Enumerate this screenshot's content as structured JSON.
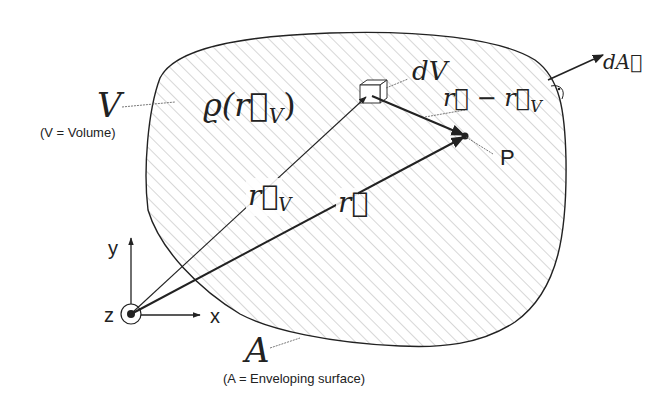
{
  "diagram": {
    "type": "physics-vector-field-volume",
    "colors": {
      "ink": "#222222",
      "hatch": "#9a9a9a",
      "background": "#ffffff"
    },
    "volume": {
      "symbol": "V",
      "caption": "(V = Volume)",
      "density_label": "ϱ(r⃗",
      "density_sub": "V",
      "density_close": ")"
    },
    "surface": {
      "symbol": "A",
      "caption": "(A = Enveloping surface)",
      "normal_label": "dA⃗"
    },
    "element": {
      "label": "dV"
    },
    "vectors": {
      "r": "r⃗",
      "rv": "r⃗",
      "rv_sub": "V",
      "diff": "r⃗ − r⃗",
      "diff_sub": "V"
    },
    "point": {
      "label": "P"
    },
    "axes": {
      "x": "x",
      "y": "y",
      "z": "z"
    }
  }
}
